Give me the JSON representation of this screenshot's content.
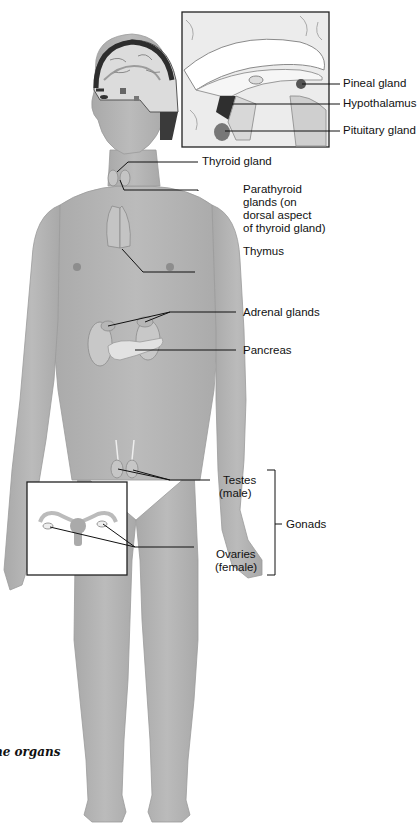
{
  "figure": {
    "caption": "ne organs",
    "colors": {
      "skin": "#b4b4b4",
      "skin_shadow": "#a3a3a3",
      "organ": "#c6c6c6",
      "hair": "#3a3a3a",
      "leader_line": "#111111",
      "inset_border": "#222222"
    }
  },
  "labels": {
    "pineal": "Pineal gland",
    "hypothalamus": "Hypothalamus",
    "pituitary": "Pituitary gland",
    "thyroid": "Thyroid gland",
    "parathyroid": [
      "Parathyroid",
      "glands (on",
      "dorsal aspect",
      "of thyroid gland)"
    ],
    "thymus": "Thymus",
    "adrenal": "Adrenal glands",
    "pancreas": "Pancreas",
    "testes": [
      "Testes",
      "(male)"
    ],
    "ovaries": [
      "Ovaries",
      "(female)"
    ],
    "gonads": "Gonads"
  },
  "insets": {
    "brain": "Brain sagittal section inset",
    "female_reproductive": "Female reproductive organs inset"
  }
}
